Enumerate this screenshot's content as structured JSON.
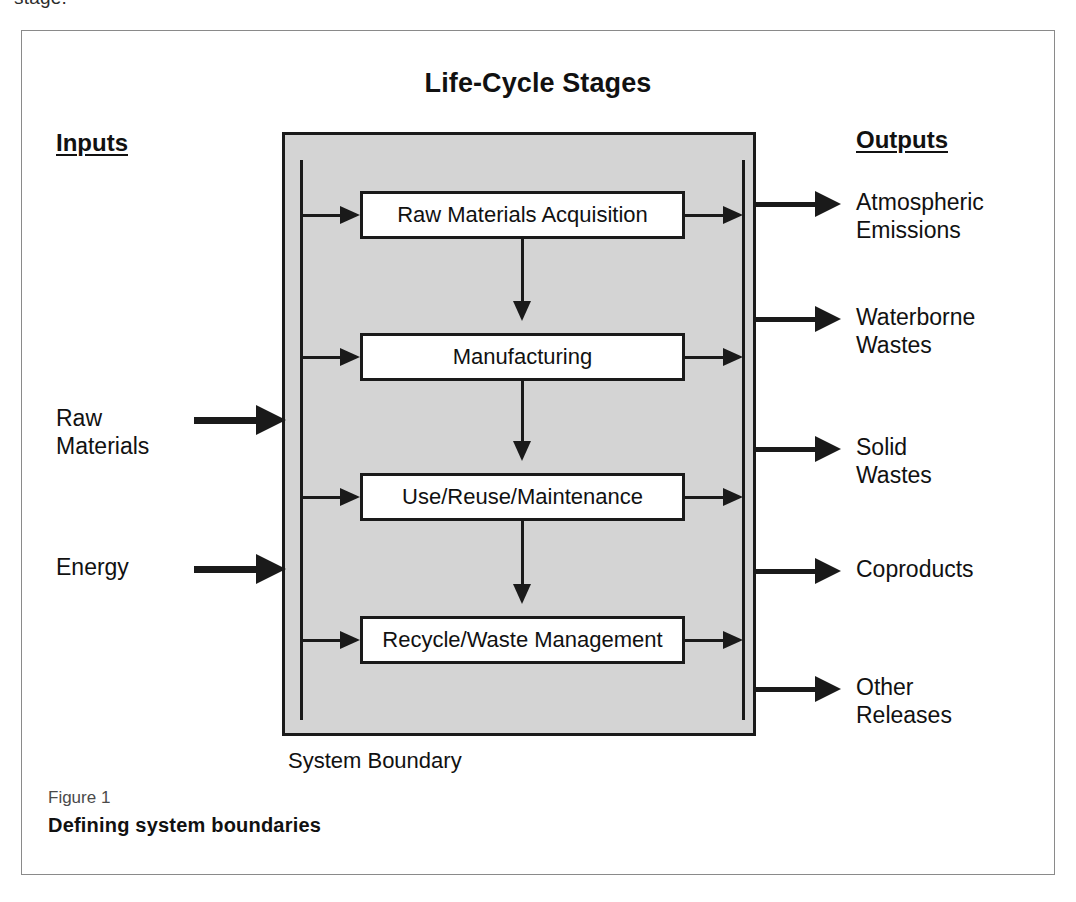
{
  "page": {
    "cropped_text_fragment": "stage."
  },
  "figure": {
    "title": "Life-Cycle Stages",
    "inputs_heading": "Inputs",
    "outputs_heading": "Outputs",
    "boundary_label": "System Boundary",
    "caption_kicker": "Figure 1",
    "caption_title": "Defining system boundaries"
  },
  "colors": {
    "boundary_fill": "#d4d4d4",
    "stroke": "#1a1a1a",
    "box_fill": "#ffffff",
    "frame_border": "#8a8a8a"
  },
  "stages": [
    {
      "label": "Raw Materials Acquisition"
    },
    {
      "label": "Manufacturing"
    },
    {
      "label": "Use/Reuse/Maintenance"
    },
    {
      "label": "Recycle/Waste Management"
    }
  ],
  "inputs": [
    {
      "line1": "Raw",
      "line2": "Materials"
    },
    {
      "line1": "Energy",
      "line2": ""
    }
  ],
  "outputs": [
    {
      "line1": "Atmospheric",
      "line2": "Emissions"
    },
    {
      "line1": "Waterborne",
      "line2": "Wastes"
    },
    {
      "line1": "Solid",
      "line2": "Wastes"
    },
    {
      "line1": "Coproducts",
      "line2": ""
    },
    {
      "line1": "Other",
      "line2": "Releases"
    }
  ]
}
